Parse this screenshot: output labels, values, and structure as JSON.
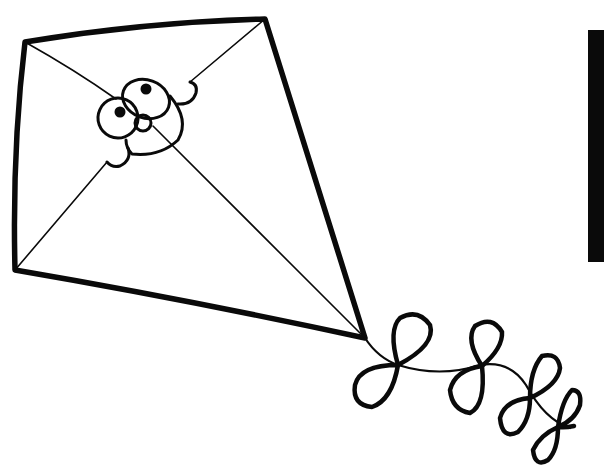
{
  "illustration": {
    "subject": "kite with face and bow tail",
    "style": "black line-art coloring page",
    "colors": {
      "background": "#ffffff",
      "ink": "#0a0a0a"
    }
  }
}
